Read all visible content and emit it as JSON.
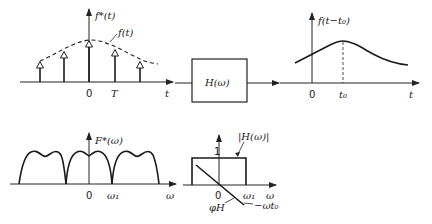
{
  "diagram": {
    "top_left": {
      "y_label": "f*(t)",
      "envelope_label": "f(t)",
      "x_label": "t",
      "ticks": [
        "0",
        "T"
      ]
    },
    "filter_block": {
      "label": "H(ω)"
    },
    "top_right": {
      "y_label": "f(t−t₀)",
      "x_label": "t",
      "ticks": [
        "0",
        "t₀"
      ]
    },
    "bottom_left": {
      "y_label": "F*(ω)",
      "x_label": "ω",
      "ticks": [
        "0",
        "ω₁"
      ]
    },
    "bottom_right": {
      "magnitude_label": "|H(ω)|",
      "level_label": "1",
      "x_label": "ω",
      "ticks": [
        "0",
        "ω₁"
      ],
      "phase_label": "φH",
      "phase_expr": "−ωt₀"
    },
    "colors": {
      "ink": "#1a1a1a",
      "background": "#ffffff"
    }
  }
}
